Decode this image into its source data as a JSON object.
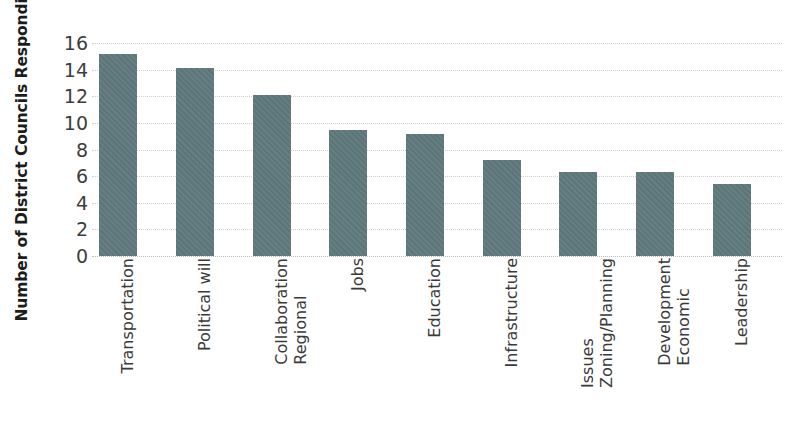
{
  "chart_data": {
    "type": "bar",
    "title": "",
    "subtitle": "",
    "xlabel": "",
    "ylabel": "Number of District Councils Responding",
    "ylim": [
      0,
      16
    ],
    "ytick_labels": [
      "0",
      "2",
      "4",
      "6",
      "8",
      "10",
      "12",
      "14",
      "16"
    ],
    "ytick_values": [
      0,
      2,
      4,
      6,
      8,
      10,
      12,
      14,
      16
    ],
    "grid": true,
    "grid_axis": "y",
    "legend": false,
    "legend_position": "none",
    "bar_color": "#5e797c",
    "categories": [
      "Transportation",
      "Political will",
      "Regional Collaboration",
      "Jobs",
      "Education",
      "Infrastructure",
      "Zoning/Planning Issues",
      "Economic Development",
      "Leadership"
    ],
    "category_lines": [
      [
        "Transportation"
      ],
      [
        "Political will"
      ],
      [
        "Regional",
        "Collaboration"
      ],
      [
        "Jobs"
      ],
      [
        "Education"
      ],
      [
        "Infrastructure"
      ],
      [
        "Zoning/Planning",
        "Issues"
      ],
      [
        "Economic",
        "Development"
      ],
      [
        "Leadership"
      ]
    ],
    "values": [
      15.2,
      14.1,
      12.1,
      9.5,
      9.2,
      7.2,
      6.3,
      6.3,
      5.4
    ]
  }
}
